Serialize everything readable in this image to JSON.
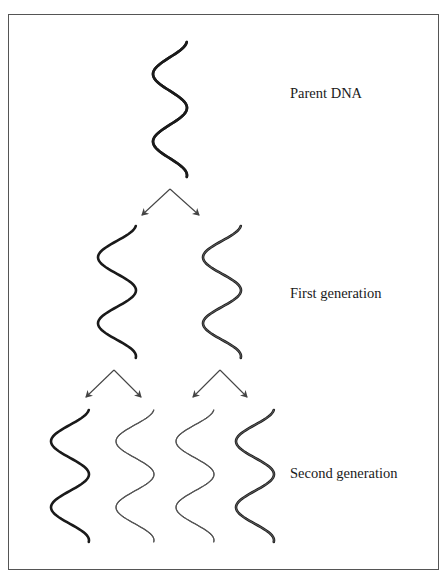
{
  "colors": {
    "old_strand": "#1a1a1a",
    "new_strand": "#555555",
    "arrow": "#444444",
    "border": "#555555"
  },
  "labels": {
    "parent": "Parent DNA",
    "first_generation": "First generation",
    "second_generation": "Second generation"
  },
  "helices": [
    {
      "id": "parent",
      "cx": 170,
      "top": 42,
      "bottom": 177,
      "width": 34,
      "strandA": "old",
      "strandB": "old"
    },
    {
      "id": "gen1-left",
      "cx": 117,
      "top": 226,
      "bottom": 358,
      "width": 38,
      "strandA": "old",
      "strandB": "new"
    },
    {
      "id": "gen1-right",
      "cx": 222,
      "top": 226,
      "bottom": 358,
      "width": 38,
      "strandA": "new",
      "strandB": "old"
    },
    {
      "id": "gen2-a",
      "cx": 70,
      "top": 410,
      "bottom": 542,
      "width": 38,
      "strandA": "old",
      "strandB": "new"
    },
    {
      "id": "gen2-b",
      "cx": 135,
      "top": 410,
      "bottom": 542,
      "width": 38,
      "strandA": "new",
      "strandB": "new"
    },
    {
      "id": "gen2-c",
      "cx": 195,
      "top": 410,
      "bottom": 542,
      "width": 38,
      "strandA": "new",
      "strandB": "new"
    },
    {
      "id": "gen2-d",
      "cx": 255,
      "top": 410,
      "bottom": 542,
      "width": 38,
      "strandA": "new",
      "strandB": "old"
    }
  ],
  "arrows": [
    {
      "from": [
        170,
        189
      ],
      "to": [
        142,
        215
      ]
    },
    {
      "from": [
        170,
        189
      ],
      "to": [
        199,
        215
      ]
    },
    {
      "from": [
        114,
        370
      ],
      "to": [
        86,
        397
      ]
    },
    {
      "from": [
        114,
        370
      ],
      "to": [
        141,
        397
      ]
    },
    {
      "from": [
        220,
        370
      ],
      "to": [
        193,
        397
      ]
    },
    {
      "from": [
        220,
        370
      ],
      "to": [
        247,
        397
      ]
    }
  ]
}
